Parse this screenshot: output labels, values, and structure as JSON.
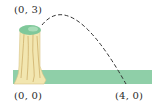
{
  "diagram": {
    "type": "projectile-path",
    "labels": {
      "start": "(0, 3)",
      "origin": "(0, 0)",
      "end": "(4, 0)"
    },
    "points": [
      {
        "name": "start",
        "x": 0,
        "y": 3
      },
      {
        "name": "origin",
        "x": 0,
        "y": 0
      },
      {
        "name": "end",
        "x": 4,
        "y": 0
      }
    ],
    "colors": {
      "ground": "#8fcfa8",
      "stump_wood": "#f2e6b0",
      "stump_lines": "#c8a860",
      "stump_top": "#7fc89a",
      "path": "#333333",
      "label": "#2a2a2a"
    }
  }
}
